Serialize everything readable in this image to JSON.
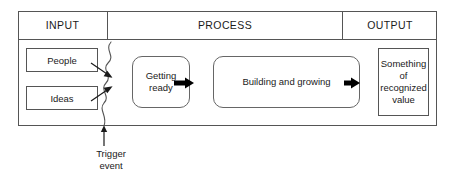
{
  "diagram": {
    "columns": [
      {
        "id": "input",
        "label": "INPUT"
      },
      {
        "id": "process",
        "label": "PROCESS"
      },
      {
        "id": "output",
        "label": "OUTPUT"
      }
    ],
    "inputs": [
      {
        "id": "people",
        "label": "People"
      },
      {
        "id": "ideas",
        "label": "Ideas"
      }
    ],
    "process_steps": [
      {
        "id": "getting-ready",
        "label": "Getting ready"
      },
      {
        "id": "building",
        "label": "Building and growing"
      }
    ],
    "output": {
      "id": "recognized-value",
      "label": "Something of recognized value"
    },
    "annotation": {
      "id": "trigger-event",
      "line1": "Trigger",
      "line2": "event"
    },
    "colors": {
      "stroke": "#555555",
      "rounded_stroke": "#666666",
      "arrow_thick": "#000000",
      "arrow_thin": "#1a1a1a",
      "squiggle": "#555555",
      "text": "#1a1a1a",
      "background": "#ffffff"
    }
  }
}
